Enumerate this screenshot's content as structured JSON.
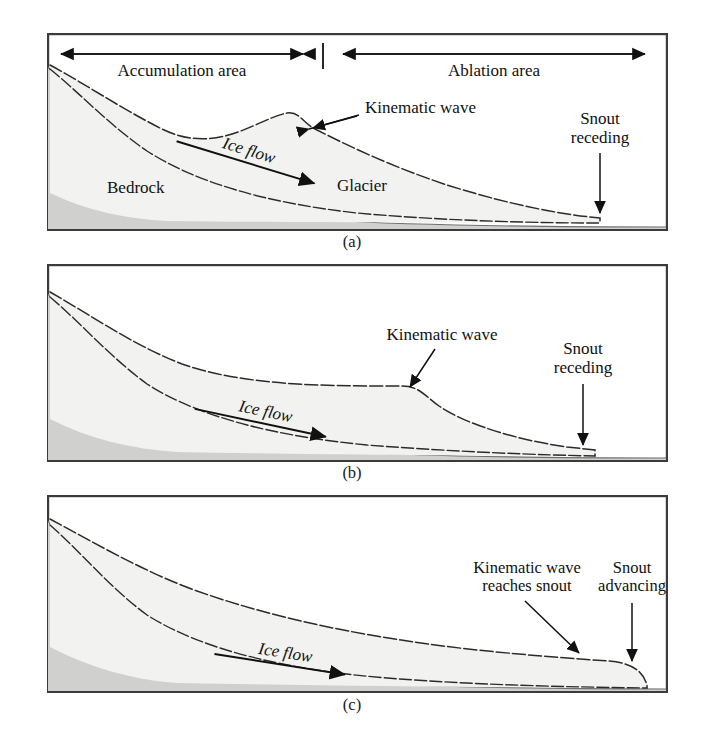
{
  "figure": {
    "panels": [
      {
        "id": "a",
        "caption": "(a)",
        "labels": {
          "accumulation": "Accumulation area",
          "ablation": "Ablation area",
          "bedrock": "Bedrock",
          "glacier": "Glacier",
          "ice_flow": "Ice flow",
          "kinematic_wave": "Kinematic wave",
          "snout_line1": "Snout",
          "snout_line2": "receding"
        }
      },
      {
        "id": "b",
        "caption": "(b)",
        "labels": {
          "ice_flow": "Ice flow",
          "kinematic_wave": "Kinematic wave",
          "snout_line1": "Snout",
          "snout_line2": "receding"
        }
      },
      {
        "id": "c",
        "caption": "(c)",
        "labels": {
          "ice_flow": "Ice flow",
          "kinematic_line1": "Kinematic wave",
          "kinematic_line2": "reaches snout",
          "snout_line1": "Snout",
          "snout_line2": "advancing"
        }
      }
    ],
    "colors": {
      "bedrock_fill": "#d0d0ce",
      "glacier_fill": "#f2f2f0",
      "outline": "#2b2b2b",
      "frame": "#3b3b3b",
      "text": "#111111"
    }
  }
}
